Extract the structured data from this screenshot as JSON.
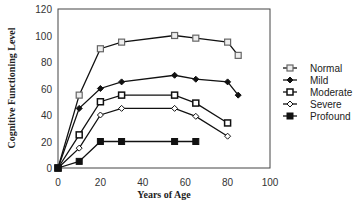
{
  "chart_data": {
    "type": "line",
    "title": "",
    "xlabel": "Years of Age",
    "ylabel": "Cognitive Functioning Level",
    "xlim": [
      0,
      100
    ],
    "ylim": [
      0,
      120
    ],
    "xticks": [
      0,
      20,
      40,
      60,
      80,
      100
    ],
    "yticks": [
      0,
      20,
      40,
      60,
      80,
      100,
      120
    ],
    "grid": false,
    "legend_position": "right",
    "series": [
      {
        "name": "Normal",
        "marker": "square-open-gray",
        "points": [
          [
            0,
            0
          ],
          [
            10,
            55
          ],
          [
            20,
            90
          ],
          [
            30,
            95
          ],
          [
            55,
            100
          ],
          [
            65,
            98
          ],
          [
            80,
            95
          ],
          [
            85,
            85
          ]
        ]
      },
      {
        "name": "Mild",
        "marker": "diamond-filled",
        "points": [
          [
            0,
            0
          ],
          [
            10,
            45
          ],
          [
            20,
            60
          ],
          [
            30,
            65
          ],
          [
            55,
            70
          ],
          [
            65,
            67
          ],
          [
            80,
            65
          ],
          [
            85,
            55
          ]
        ]
      },
      {
        "name": "Moderate",
        "marker": "square-open-bold",
        "points": [
          [
            0,
            0
          ],
          [
            10,
            25
          ],
          [
            20,
            50
          ],
          [
            30,
            55
          ],
          [
            55,
            55
          ],
          [
            65,
            49
          ],
          [
            80,
            34
          ]
        ]
      },
      {
        "name": "Severe",
        "marker": "diamond-open",
        "points": [
          [
            0,
            0
          ],
          [
            10,
            15
          ],
          [
            20,
            40
          ],
          [
            30,
            45
          ],
          [
            55,
            45
          ],
          [
            65,
            39
          ],
          [
            80,
            24
          ]
        ]
      },
      {
        "name": "Profound",
        "marker": "square-filled",
        "points": [
          [
            0,
            0
          ],
          [
            10,
            5
          ],
          [
            20,
            20
          ],
          [
            30,
            20
          ],
          [
            55,
            20
          ],
          [
            65,
            20
          ]
        ]
      }
    ]
  }
}
